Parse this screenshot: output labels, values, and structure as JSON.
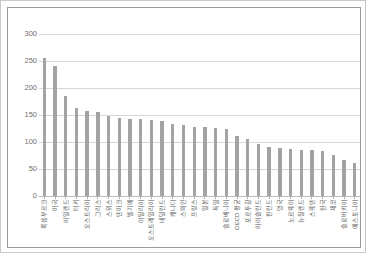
{
  "chart_data": {
    "type": "bar",
    "title": "",
    "subtitle": "",
    "xlabel": "",
    "ylabel": "",
    "ylim": [
      0,
      300
    ],
    "yticks": [
      0,
      50,
      100,
      150,
      200,
      250,
      300
    ],
    "ytick_labels": [
      "0",
      "50",
      "100",
      "150",
      "200",
      "250",
      "300"
    ],
    "grid": true,
    "legend": false,
    "legend_position": "none",
    "bar_color": "#a3a3a3",
    "gridline_color": "#d6d6d6",
    "categories": [
      "룩셈부르크",
      "미국",
      "아일랜드",
      "터키",
      "오스트리아",
      "그리스",
      "스위스",
      "덴마크",
      "벨기에",
      "이탈리아",
      "오스트레일리아",
      "네덜란드",
      "캐나다",
      "스페인",
      "프랑스",
      "일본",
      "독일",
      "슬로베니아",
      "OECD 평균",
      "포르투갈",
      "아이슬란드",
      "핀란드",
      "영국",
      "노르웨이",
      "뉴질랜드",
      "스웨덴",
      "한국",
      "체코",
      "슬로바키아",
      "에스토니아"
    ],
    "values": [
      256,
      240,
      186,
      163,
      157,
      155,
      148,
      145,
      143,
      142,
      140,
      139,
      134,
      131,
      128,
      127,
      126,
      125,
      112,
      105,
      97,
      90,
      88,
      87,
      86,
      85,
      83,
      76,
      66,
      62
    ]
  }
}
